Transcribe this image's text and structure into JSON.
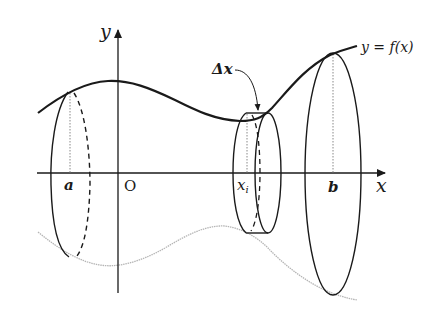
{
  "diagram": {
    "labels": {
      "y_axis": "y",
      "x_axis": "x",
      "origin": "O",
      "a": "a",
      "b": "b",
      "xi": "x",
      "xi_sub": "i",
      "delta_x": "Δx",
      "function": "y = f(x)"
    },
    "colors": {
      "stroke": "#1a1a1a",
      "mirror_curve": "#b5b5b5",
      "background": "#ffffff"
    }
  }
}
